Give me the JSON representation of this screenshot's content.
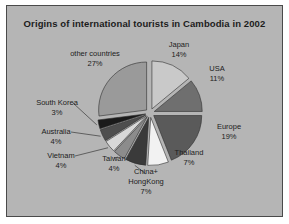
{
  "panel": {
    "background_color": "#b5b5b5",
    "border_color": "#4a4a4a"
  },
  "chart_data": {
    "type": "pie",
    "title": "Origins of international tourists in Cambodia in 2002",
    "xlabel": "",
    "ylabel": "",
    "exploded": true,
    "legend_position": "none",
    "grid": false,
    "labels_show_percent": true,
    "categories": [
      "Japan",
      "USA",
      "Europe",
      "Thailand",
      "China+ HongKong",
      "Taiwan",
      "Vietnam",
      "Australia",
      "South Korea",
      "other countries"
    ],
    "values": [
      14,
      11,
      19,
      7,
      7,
      4,
      4,
      4,
      3,
      27
    ],
    "slices": [
      {
        "name": "Japan",
        "label": "Japan",
        "percent": 14,
        "percent_text": "14%",
        "color": "#c9c9c9"
      },
      {
        "name": "USA",
        "label": "USA",
        "percent": 11,
        "percent_text": "11%",
        "color": "#6f6f6f"
      },
      {
        "name": "Europe",
        "label": "Europe",
        "percent": 19,
        "percent_text": "19%",
        "color": "#5a5a5a"
      },
      {
        "name": "Thailand",
        "label": "Thailand",
        "percent": 7,
        "percent_text": "7%",
        "color": "#f2f2f2"
      },
      {
        "name": "China+ HongKong",
        "label": "China+",
        "label_line2": "HongKong",
        "percent": 7,
        "percent_text": "7%",
        "color": "#3a3a3a"
      },
      {
        "name": "Taiwan",
        "label": "Taiwan",
        "percent": 4,
        "percent_text": "4%",
        "color": "#8c8c8c"
      },
      {
        "name": "Vietnam",
        "label": "Vietnam",
        "percent": 4,
        "percent_text": "4%",
        "color": "#d8d8d8"
      },
      {
        "name": "Australia",
        "label": "Australia",
        "percent": 4,
        "percent_text": "4%",
        "color": "#4e4e4e"
      },
      {
        "name": "South Korea",
        "label": "South Korea",
        "percent": 3,
        "percent_text": "3%",
        "color": "#1a1a1a"
      },
      {
        "name": "other countries",
        "label": "other countries",
        "percent": 27,
        "percent_text": "27%",
        "color": "#9a9a9a"
      }
    ]
  }
}
